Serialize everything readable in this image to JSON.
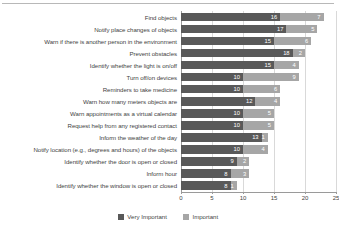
{
  "chart_data": {
    "type": "bar",
    "orientation": "horizontal",
    "stacked": true,
    "title": "",
    "subtitle": "",
    "xlabel": "",
    "ylabel": "",
    "xlim": [
      0,
      25
    ],
    "xticks": [
      0,
      5,
      10,
      15,
      20,
      25
    ],
    "xtick_labels": [
      "0",
      "5",
      "10",
      "15",
      "20",
      "25"
    ],
    "grid": true,
    "grid_axis": "x",
    "legend_position": "bottom-center",
    "categories": [
      "Find objects",
      "Notify place changes of objects",
      "Warn if there is another person in the environment",
      "Prevent obstacles",
      "Identify whether the light is on/off",
      "Turn off/on devices",
      "Reminders to take medicine",
      "Warn how many meters objects are",
      "Warn appointments as a virtual calendar",
      "Request help from any registered contact",
      "Inform the weather of the day",
      "Notify location (e.g., degrees and hours) of the objects",
      "Identify whether the door is open or closed",
      "Inform hour",
      "Identify whether the window is open or closed"
    ],
    "series": [
      {
        "name": "Very Important",
        "color": "#595959",
        "values": [
          16,
          17,
          15,
          18,
          15,
          10,
          10,
          12,
          10,
          10,
          13,
          10,
          9,
          8,
          8
        ]
      },
      {
        "name": "Important",
        "color": "#a6a6a6",
        "values": [
          7,
          5,
          6,
          2,
          4,
          9,
          6,
          4,
          5,
          5,
          1,
          4,
          2,
          3,
          1
        ]
      }
    ]
  },
  "legend": {
    "items": [
      {
        "label": "Very Important",
        "color": "#595959"
      },
      {
        "label": "Important",
        "color": "#a6a6a6"
      }
    ]
  }
}
